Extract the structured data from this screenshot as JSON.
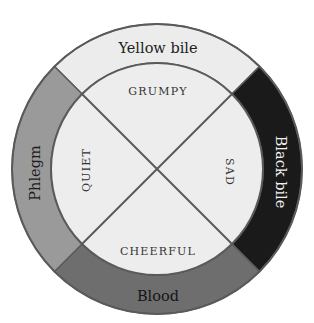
{
  "diagram": {
    "geometry": {
      "cx": 157,
      "cy": 169,
      "outer_r": 145,
      "inner_r": 106
    },
    "humours": [
      {
        "id": "yellow-bile",
        "label": "Yellow bile",
        "position": "top",
        "color": "#ececec",
        "text_color": "#222222"
      },
      {
        "id": "black-bile",
        "label": "Black bile",
        "position": "right",
        "color": "#1a1a1a",
        "text_color": "#f2f2f2"
      },
      {
        "id": "blood",
        "label": "Blood",
        "position": "bottom",
        "color": "#6e6e6e",
        "text_color": "#151515"
      },
      {
        "id": "phlegm",
        "label": "Phlegm",
        "position": "left",
        "color": "#9a9a9a",
        "text_color": "#1c1c1c"
      }
    ],
    "temperaments": [
      {
        "id": "grumpy",
        "label": "GRUMPY",
        "position": "top"
      },
      {
        "id": "sad",
        "label": "SAD",
        "position": "right"
      },
      {
        "id": "cheerful",
        "label": "CHEERFUL",
        "position": "bottom"
      },
      {
        "id": "quiet",
        "label": "QUIET",
        "position": "left"
      }
    ],
    "colors": {
      "inner_fill": "#ededed",
      "line": "#5a5a5a",
      "background": "#ffffff"
    }
  }
}
